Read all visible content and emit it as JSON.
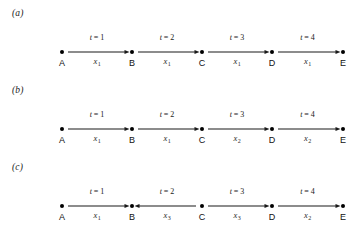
{
  "figure": {
    "background_color": "#ffffff",
    "ink_color": "#1a1a1a",
    "node_positions_px": [
      62,
      132,
      202,
      272,
      343
    ],
    "node_labels": [
      "A",
      "B",
      "C",
      "D",
      "E"
    ]
  },
  "panels": [
    {
      "label": "(a)",
      "nodes": [
        {
          "label": "A"
        },
        {
          "label": "B"
        },
        {
          "label": "C"
        },
        {
          "label": "D"
        },
        {
          "label": "E"
        }
      ],
      "edges": [
        {
          "time_label": "t = 1",
          "time_var": "t",
          "time_value": "1",
          "weight_var": "x",
          "weight_sub": "1",
          "direction": "right",
          "from": "A",
          "to": "B"
        },
        {
          "time_label": "t = 2",
          "time_var": "t",
          "time_value": "2",
          "weight_var": "x",
          "weight_sub": "1",
          "direction": "right",
          "from": "B",
          "to": "C"
        },
        {
          "time_label": "t = 3",
          "time_var": "t",
          "time_value": "3",
          "weight_var": "x",
          "weight_sub": "1",
          "direction": "right",
          "from": "C",
          "to": "D"
        },
        {
          "time_label": "t = 4",
          "time_var": "t",
          "time_value": "4",
          "weight_var": "x",
          "weight_sub": "1",
          "direction": "right",
          "from": "D",
          "to": "E"
        }
      ]
    },
    {
      "label": "(b)",
      "nodes": [
        {
          "label": "A"
        },
        {
          "label": "B"
        },
        {
          "label": "C"
        },
        {
          "label": "D"
        },
        {
          "label": "E"
        }
      ],
      "edges": [
        {
          "time_label": "t = 1",
          "time_var": "t",
          "time_value": "1",
          "weight_var": "x",
          "weight_sub": "1",
          "direction": "right",
          "from": "A",
          "to": "B"
        },
        {
          "time_label": "t = 2",
          "time_var": "t",
          "time_value": "2",
          "weight_var": "x",
          "weight_sub": "1",
          "direction": "right",
          "from": "B",
          "to": "C"
        },
        {
          "time_label": "t = 3",
          "time_var": "t",
          "time_value": "3",
          "weight_var": "x",
          "weight_sub": "2",
          "direction": "right",
          "from": "C",
          "to": "D"
        },
        {
          "time_label": "t = 4",
          "time_var": "t",
          "time_value": "4",
          "weight_var": "x",
          "weight_sub": "2",
          "direction": "right",
          "from": "D",
          "to": "E"
        }
      ]
    },
    {
      "label": "(c)",
      "nodes": [
        {
          "label": "A"
        },
        {
          "label": "B"
        },
        {
          "label": "C"
        },
        {
          "label": "D"
        },
        {
          "label": "E"
        }
      ],
      "edges": [
        {
          "time_label": "t = 1",
          "time_var": "t",
          "time_value": "1",
          "weight_var": "x",
          "weight_sub": "1",
          "direction": "right",
          "from": "A",
          "to": "B"
        },
        {
          "time_label": "t = 2",
          "time_var": "t",
          "time_value": "2",
          "weight_var": "x",
          "weight_sub": "3",
          "direction": "left",
          "from": "C",
          "to": "B"
        },
        {
          "time_label": "t = 3",
          "time_var": "t",
          "time_value": "3",
          "weight_var": "x",
          "weight_sub": "3",
          "direction": "right",
          "from": "C",
          "to": "D"
        },
        {
          "time_label": "t = 4",
          "time_var": "t",
          "time_value": "4",
          "weight_var": "x",
          "weight_sub": "2",
          "direction": "right",
          "from": "D",
          "to": "E"
        }
      ]
    }
  ]
}
